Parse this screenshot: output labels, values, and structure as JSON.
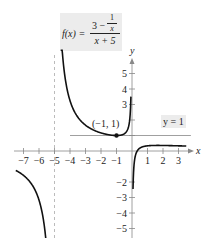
{
  "chart_data": {
    "type": "line",
    "title": "",
    "function_label": {
      "lhs": "f(x) =",
      "numerator_whole": "3 −",
      "inner_numerator": "1",
      "inner_denominator": "x",
      "denominator": "x + 5"
    },
    "xlabel": "x",
    "ylabel": "y",
    "xlim": [
      -7.5,
      3.8
    ],
    "ylim": [
      -5.5,
      6
    ],
    "x_ticks": [
      -7,
      -6,
      -5,
      -4,
      -3,
      -2,
      -1,
      1,
      2,
      3
    ],
    "x_tick_labels": [
      "−7",
      "−6",
      "−5",
      "−4",
      "−3",
      "−2",
      "−1",
      "1",
      "2",
      "3"
    ],
    "y_ticks": [
      -5,
      -4,
      -3,
      -2,
      1,
      2,
      3,
      4,
      5
    ],
    "y_tick_labels_shown": [
      {
        "value": 5,
        "label": "5"
      },
      {
        "value": 4,
        "label": "4"
      },
      {
        "value": 3,
        "label": "3"
      },
      {
        "value": -2,
        "label": "−2"
      },
      {
        "value": -3,
        "label": "−3"
      },
      {
        "value": -4,
        "label": "−4"
      },
      {
        "value": -5,
        "label": "−5"
      }
    ],
    "vertical_asymptote": {
      "x": -5,
      "style": "dashed"
    },
    "horizontal_line": {
      "y": 1,
      "label": "y = 1",
      "x_range": [
        -4,
        3.8
      ]
    },
    "marked_point": {
      "x": -1,
      "y": 1,
      "label": "(−1, 1)"
    },
    "series": [
      {
        "name": "left branch",
        "x_range": [
          -7.5,
          -5.08
        ],
        "formula": "(3 - 1/x)/(x + 5)"
      },
      {
        "name": "middle branch",
        "x_range": [
          -4.6,
          -0.07
        ],
        "formula": "(3 - 1/x)/(x + 5)"
      },
      {
        "name": "right branch",
        "x_range": [
          0.065,
          3.5
        ],
        "formula": "(3 - 1/x)/(x + 5)"
      }
    ],
    "grid": false,
    "legend": null
  },
  "labels": {
    "y_equals_1": "y = 1",
    "point": "(−1, 1)",
    "x_axis": "x",
    "y_axis": "y"
  }
}
